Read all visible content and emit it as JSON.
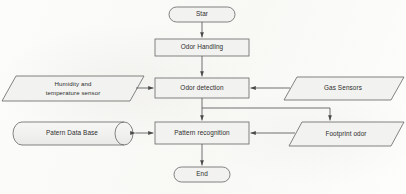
{
  "diagram": {
    "background_color": "#fdfdfc",
    "node_fill_color": "#f2f2f0",
    "node_border_color": "#6e6e6e",
    "connector_color": "#595959",
    "text_color": "#2d2d2d"
  },
  "nodes": {
    "start": {
      "label": "Star",
      "shape": "terminator"
    },
    "odor_handling": {
      "label": "Odor Handling",
      "shape": "process"
    },
    "odor_detection": {
      "label": "Odor detection",
      "shape": "process"
    },
    "pattern_recognition": {
      "label": "Pattern recognition",
      "shape": "process"
    },
    "end": {
      "label": "End",
      "shape": "terminator"
    },
    "humidity_sensor": {
      "label": "Humidity and\ntemperature sensor",
      "shape": "parallelogram-input"
    },
    "gas_sensors": {
      "label": "Gas Sensors",
      "shape": "parallelogram-input"
    },
    "pattern_database": {
      "label": "Patern Data Base",
      "shape": "cylinder-database"
    },
    "footprint_odor": {
      "label": "Footprint odor",
      "shape": "parallelogram-input"
    }
  },
  "connectors": [
    {
      "name": "start-to-odor-handling",
      "from": "start",
      "to": "odor_handling",
      "direction": "down",
      "arrow": "single"
    },
    {
      "name": "odor-handling-to-odor-detection",
      "from": "odor_handling",
      "to": "odor_detection",
      "direction": "down",
      "arrow": "single"
    },
    {
      "name": "humidity-sensor-to-odor-detection",
      "from": "humidity_sensor",
      "to": "odor_detection",
      "direction": "right",
      "arrow": "single"
    },
    {
      "name": "gas-sensors-to-odor-detection",
      "from": "gas_sensors",
      "to": "odor_detection",
      "direction": "left",
      "arrow": "single"
    },
    {
      "name": "odor-detection-to-pattern-recognition",
      "from": "odor_detection",
      "to": "pattern_recognition",
      "direction": "down",
      "arrow": "single"
    },
    {
      "name": "odor-detection-to-footprint-odor",
      "from": "odor_detection",
      "to": "footprint_odor",
      "direction": "right-down",
      "arrow": "single"
    },
    {
      "name": "pattern-database-to-pattern-recognition",
      "from": "pattern_database",
      "to": "pattern_recognition",
      "direction": "bidirectional",
      "arrow": "double"
    },
    {
      "name": "footprint-odor-to-pattern-recognition",
      "from": "footprint_odor",
      "to": "pattern_recognition",
      "direction": "left",
      "arrow": "single"
    },
    {
      "name": "pattern-recognition-to-end",
      "from": "pattern_recognition",
      "to": "end",
      "direction": "down",
      "arrow": "single"
    }
  ]
}
